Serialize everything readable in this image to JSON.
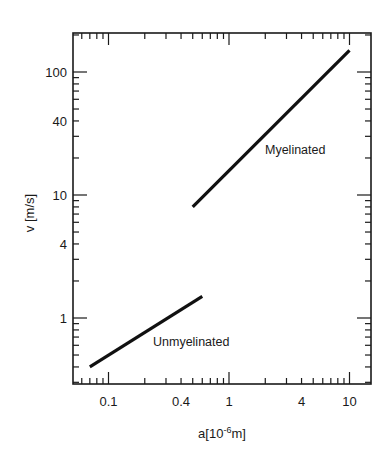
{
  "chart_data": {
    "type": "line",
    "title": "",
    "xlabel": "a[10^-6 m]",
    "xlabel_main": "a[10",
    "xlabel_sup": "-6",
    "xlabel_tail": "m]",
    "ylabel": "v [m/s]",
    "xscale": "log",
    "yscale": "log",
    "xlim": [
      0.07,
      13
    ],
    "ylim": [
      0.3,
      250
    ],
    "grid": false,
    "legend": null,
    "x_tick_labels": [
      "0.1",
      "0.4",
      "1",
      "4",
      "10"
    ],
    "x_tick_values": [
      0.1,
      0.4,
      1,
      4,
      10
    ],
    "y_tick_labels": [
      "1",
      "4",
      "10",
      "40",
      "100"
    ],
    "y_tick_values": [
      1,
      4,
      10,
      40,
      100
    ],
    "series": [
      {
        "name": "Myelinated",
        "x": [
          0.5,
          10
        ],
        "y": [
          8,
          150
        ],
        "annotation": "Myelinated"
      },
      {
        "name": "Unmyelinated",
        "x": [
          0.07,
          0.6
        ],
        "y": [
          0.4,
          1.5
        ],
        "annotation": "Unmyelinated"
      }
    ]
  }
}
